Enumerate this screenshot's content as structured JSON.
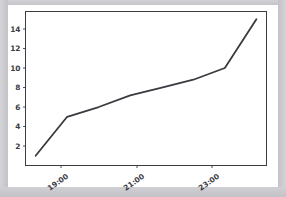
{
  "figure": {
    "background_color": "#ffffff",
    "mat_color": "#c9c9ce",
    "axes_border_color": "#3c3c42",
    "line_color": "#3a3a40",
    "tick_label_color": "#3c3c42"
  },
  "chart_data": {
    "type": "line",
    "title": "",
    "xlabel": "",
    "ylabel": "",
    "x": [
      "18:30",
      "19:20",
      "20:05",
      "21:00",
      "21:25",
      "22:10",
      "23:10",
      "23:55"
    ],
    "values": [
      1.0,
      5.0,
      6.0,
      7.2,
      8.0,
      8.8,
      10.0,
      15.0
    ],
    "series": [
      {
        "name": "series-1",
        "values": [
          1.0,
          5.0,
          6.0,
          7.2,
          8.0,
          8.8,
          10.0,
          15.0
        ]
      }
    ],
    "xtick_labels": [
      "19:00",
      "21:00",
      "23:00"
    ],
    "ytick_labels": [
      "2",
      "4",
      "6",
      "8",
      "10",
      "12",
      "14"
    ],
    "ytick_values": [
      2,
      4,
      6,
      8,
      10,
      12,
      14
    ],
    "ylim": [
      0.0,
      15.8
    ],
    "xlim": [
      0,
      1
    ],
    "grid": false,
    "legend": false,
    "xtick_rotation_degrees": -35,
    "line_width": 1.8
  }
}
